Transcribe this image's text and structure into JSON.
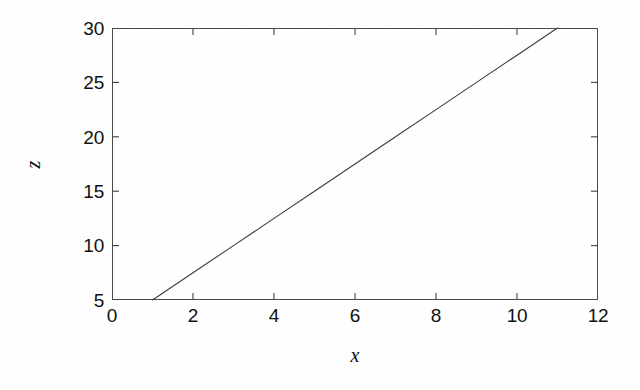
{
  "chart_data": {
    "type": "line",
    "title": "",
    "subtitle": "",
    "xlabel": "x",
    "ylabel": "z",
    "xlim": [
      0,
      12
    ],
    "ylim": [
      5,
      30
    ],
    "xticks": [
      0,
      2,
      4,
      6,
      8,
      10,
      12
    ],
    "yticks": [
      5,
      10,
      15,
      20,
      25,
      30
    ],
    "xtick_labels": [
      "0",
      "2",
      "4",
      "6",
      "8",
      "10",
      "12"
    ],
    "ytick_labels": [
      "5",
      "10",
      "15",
      "20",
      "25",
      "30"
    ],
    "grid": false,
    "legend": null,
    "annotations": [],
    "line_color": "#3c3c3c",
    "series": [
      {
        "name": "z = 2.5x + 2.5",
        "x": [
          1,
          2,
          3,
          4,
          5,
          6,
          7,
          8,
          9,
          10,
          11
        ],
        "values": [
          5,
          7.5,
          10,
          12.5,
          15,
          17.5,
          20,
          22.5,
          25,
          27.5,
          30
        ],
        "slope": 2.5,
        "intercept": 2.5,
        "endpoints": [
          [
            1,
            5
          ],
          [
            11,
            30
          ]
        ]
      }
    ]
  },
  "figure": {
    "background_color": "#fefefe",
    "frame_color": "#4a4a4a",
    "text_color": "#111111"
  }
}
